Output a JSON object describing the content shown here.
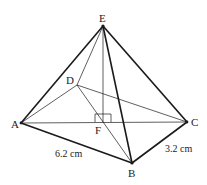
{
  "diagram": {
    "type": "pyramid",
    "points": {
      "E": {
        "label": "E",
        "x": 103,
        "y": 26
      },
      "D": {
        "label": "D",
        "x": 77,
        "y": 85
      },
      "A": {
        "label": "A",
        "x": 21,
        "y": 123
      },
      "C": {
        "label": "C",
        "x": 187,
        "y": 122
      },
      "F": {
        "label": "F",
        "x": 103,
        "y": 122
      },
      "B": {
        "label": "B",
        "x": 132,
        "y": 163
      }
    },
    "labels": {
      "E": "E",
      "D": "D",
      "A": "A",
      "C": "C",
      "F": "F",
      "B": "B"
    },
    "measurements": {
      "AB": "6.2 cm",
      "BC": "3.2 cm"
    },
    "colors": {
      "line": "#1a1a1a",
      "background": "#ffffff"
    }
  }
}
